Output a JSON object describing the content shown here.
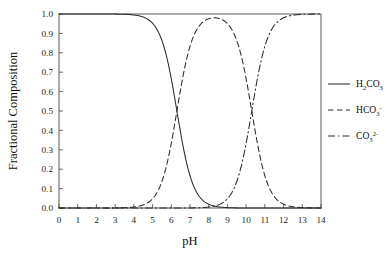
{
  "chart_data": {
    "type": "line",
    "title": "",
    "xlabel": "pH",
    "ylabel": "Fractional Composition",
    "xlim": [
      0,
      14
    ],
    "ylim": [
      0.0,
      1.0
    ],
    "grid": false,
    "legend_position": "right",
    "x_ticks": [
      "0",
      "1",
      "2",
      "3",
      "4",
      "5",
      "6",
      "7",
      "8",
      "9",
      "10",
      "11",
      "12",
      "13",
      "14"
    ],
    "y_ticks": [
      "0.0",
      "0.1",
      "0.2",
      "0.3",
      "0.4",
      "0.5",
      "0.6",
      "0.7",
      "0.8",
      "0.9",
      "1.0"
    ],
    "pka1": 6.3,
    "pka2": 10.3,
    "series": [
      {
        "name": "H2CO3",
        "label_main": "H",
        "label_sub1": "2",
        "label_mid": "CO",
        "label_sub2": "3",
        "label_sup": "",
        "linestyle": "solid",
        "color": "#2b2b2b",
        "x": [
          0,
          1,
          2,
          3,
          4,
          4.5,
          5,
          5.5,
          6,
          6.3,
          6.5,
          7,
          7.5,
          8,
          9,
          10,
          11,
          12,
          13,
          14
        ],
        "values": [
          1.0,
          1.0,
          0.999,
          0.995,
          0.952,
          0.863,
          0.666,
          0.387,
          0.666,
          0.5,
          0.387,
          0.167,
          0.059,
          0.02,
          0.002,
          0.0,
          0.0,
          0.0,
          0.0,
          0.0
        ]
      },
      {
        "name": "HCO3-",
        "label_main": "HCO",
        "label_sub1": "3",
        "label_sup": "-",
        "linestyle": "dashed",
        "color": "#2b2b2b",
        "x": [
          0,
          1,
          2,
          3,
          4,
          5,
          6,
          6.3,
          7,
          8,
          8.3,
          9,
          10,
          10.3,
          11,
          12,
          13,
          14
        ],
        "values": [
          0.0,
          0.0,
          0.001,
          0.005,
          0.048,
          0.334,
          0.666,
          0.5,
          0.832,
          0.975,
          0.98,
          0.952,
          0.666,
          0.5,
          0.167,
          0.02,
          0.002,
          0.0
        ]
      },
      {
        "name": "CO3 2-",
        "label_main": "CO",
        "label_sub1": "3",
        "label_sup": "2-",
        "linestyle": "dashdot",
        "color": "#2b2b2b",
        "x": [
          0,
          2,
          4,
          6,
          7,
          8,
          9,
          10,
          10.3,
          11,
          11.5,
          12,
          12.5,
          13,
          13.5,
          14
        ],
        "values": [
          0.0,
          0.0,
          0.0,
          0.0,
          0.0,
          0.0,
          0.005,
          0.333,
          0.5,
          0.833,
          0.94,
          0.98,
          0.994,
          0.998,
          0.999,
          1.0
        ]
      }
    ]
  },
  "legend": {
    "entries": [
      {
        "id": "h2co3",
        "text": "H2CO3"
      },
      {
        "id": "hco3",
        "text": "HCO3-"
      },
      {
        "id": "co3",
        "text": "CO3 2-"
      }
    ]
  },
  "axes": {
    "x_title": "pH",
    "y_title": "Fractional Composition"
  }
}
